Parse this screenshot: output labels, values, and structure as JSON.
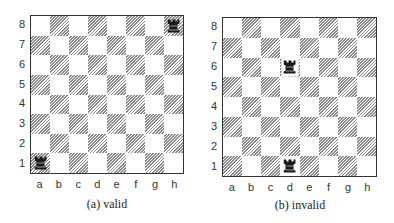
{
  "figure": {
    "files": [
      "a",
      "b",
      "c",
      "d",
      "e",
      "f",
      "g",
      "h"
    ],
    "ranks": [
      "8",
      "7",
      "6",
      "5",
      "4",
      "3",
      "2",
      "1"
    ],
    "colors": {
      "dark_hatch": "#8a8a8a",
      "light": "#ffffff",
      "border": "#333333",
      "piece": "#1a1a1a"
    },
    "boards": [
      {
        "id": "a",
        "caption": "(a) valid",
        "pieces": [
          {
            "type": "rook",
            "icon": "rook-icon",
            "color": "black",
            "square": "h8"
          },
          {
            "type": "rook",
            "icon": "rook-icon",
            "color": "black",
            "square": "a1"
          }
        ]
      },
      {
        "id": "b",
        "caption": "(b) invalid",
        "pieces": [
          {
            "type": "rook",
            "icon": "rook-icon",
            "color": "black",
            "square": "d6"
          },
          {
            "type": "rook",
            "icon": "rook-icon",
            "color": "black",
            "square": "d1"
          }
        ]
      }
    ]
  }
}
